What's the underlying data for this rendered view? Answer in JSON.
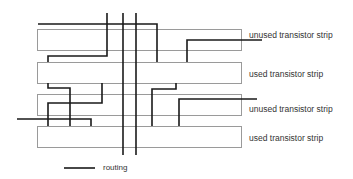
{
  "diagram": {
    "colors": {
      "strip_border": "#9a9a9a",
      "routing": "#1a1a1a",
      "text": "#333333"
    },
    "strips": [
      {
        "label": "unused transistor strip",
        "x": 37,
        "y": 29,
        "w": 204,
        "h": 21
      },
      {
        "label": "used transistor strip",
        "x": 37,
        "y": 62,
        "w": 204,
        "h": 21
      },
      {
        "label": "unused transistor strip",
        "x": 37,
        "y": 94,
        "w": 204,
        "h": 21
      },
      {
        "label": "used transistor strip",
        "x": 37,
        "y": 126,
        "w": 204,
        "h": 21
      }
    ],
    "routing": [
      "M38,24 H157 V62",
      "M107,13 V56 H48 V62",
      "M123,13 V155",
      "M136,13 V155",
      "M262,40 H187 V62",
      "M48,83 V88 H70 V126",
      "M102,83 V103 H48 V126",
      "M17,119 H91 V126",
      "M176,83 V89 H152 V126",
      "M257,99 H179 V126"
    ],
    "legend": {
      "label": "routing"
    }
  }
}
